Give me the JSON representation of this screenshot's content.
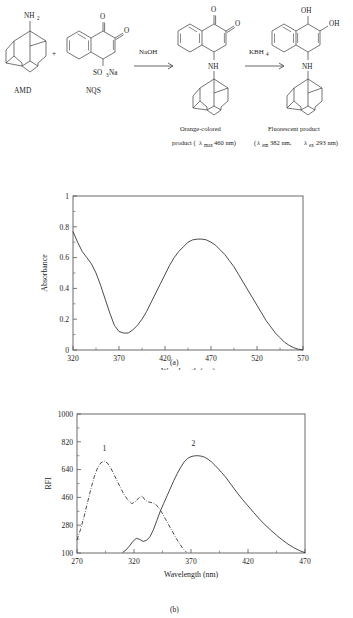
{
  "scheme": {
    "reactants": [
      {
        "name": "AMD",
        "group_label": "NH",
        "group_sub": "2"
      },
      {
        "name": "NQS",
        "group_label": "SO",
        "group_sub": "3",
        "group_tail": "Na"
      }
    ],
    "plus_sign": "+",
    "arrows": [
      {
        "reagent": "NaOH",
        "reagent_sub": ""
      },
      {
        "reagent": "KBH",
        "reagent_sub": "4"
      }
    ],
    "products": [
      {
        "nh_label": "NH",
        "o_labels": [
          "O",
          "O"
        ],
        "caption_line1": "Orange-colored",
        "caption_line2_pre": "product (",
        "caption_lambda": "λ",
        "caption_lambda_sub": "max",
        "caption_line2_post": " 460 nm)"
      },
      {
        "nh_label": "NH",
        "oh_labels": [
          "OH",
          "OH"
        ],
        "caption_line1": "Fluorescent product",
        "caption_line2_pre": "(",
        "caption_lambda1": "λ",
        "caption_lambda1_sub": "em",
        "caption_mid": " 382 nm, ",
        "caption_lambda2": "λ",
        "caption_lambda2_sub": "ex",
        "caption_line2_post": " 293 nm)"
      }
    ]
  },
  "panel_a_caption": "(a)",
  "panel_b_caption": "(b)",
  "chart_data": [
    {
      "type": "line",
      "panel": "(a)",
      "title": "",
      "xlabel": "Wavelength (nm)",
      "ylabel": "Absorbance",
      "xlim": [
        320,
        570
      ],
      "ylim": [
        0,
        1
      ],
      "xticks": [
        320,
        370,
        420,
        470,
        520,
        570
      ],
      "yticks": [
        0,
        0.2,
        0.4,
        0.6,
        0.8,
        1
      ],
      "xtick_labels": [
        "320",
        "370",
        "420",
        "470",
        "520",
        "570"
      ],
      "ytick_labels": [
        "0",
        "0.2",
        "0.4",
        "0.6",
        "0.8",
        "1"
      ],
      "minor_ticks": true,
      "grid": false,
      "legend": "none",
      "series": [
        {
          "name": "Absorption spectrum of orange-colored product",
          "style": "solid",
          "x": [
            320,
            325,
            330,
            335,
            340,
            345,
            350,
            355,
            360,
            365,
            370,
            375,
            380,
            385,
            390,
            395,
            400,
            405,
            410,
            415,
            420,
            425,
            430,
            435,
            440,
            445,
            450,
            455,
            460,
            465,
            470,
            475,
            480,
            485,
            490,
            495,
            500,
            505,
            510,
            515,
            520,
            525,
            530,
            535,
            540,
            545,
            550,
            555,
            560,
            565,
            570
          ],
          "y": [
            0.77,
            0.7,
            0.64,
            0.6,
            0.56,
            0.5,
            0.42,
            0.33,
            0.24,
            0.16,
            0.12,
            0.11,
            0.11,
            0.13,
            0.16,
            0.2,
            0.25,
            0.31,
            0.37,
            0.43,
            0.49,
            0.55,
            0.6,
            0.64,
            0.67,
            0.7,
            0.715,
            0.72,
            0.72,
            0.715,
            0.7,
            0.68,
            0.65,
            0.62,
            0.58,
            0.54,
            0.49,
            0.44,
            0.39,
            0.34,
            0.29,
            0.24,
            0.19,
            0.15,
            0.11,
            0.08,
            0.05,
            0.03,
            0.015,
            0.005,
            0.0
          ]
        }
      ]
    },
    {
      "type": "line",
      "panel": "(b)",
      "title": "",
      "xlabel": "Wavelength (nm)",
      "ylabel": "RFI",
      "xlim": [
        270,
        470
      ],
      "ylim": [
        100,
        1000
      ],
      "xticks": [
        270,
        320,
        370,
        420,
        470
      ],
      "yticks": [
        100,
        280,
        460,
        640,
        820,
        1000
      ],
      "xtick_labels": [
        "270",
        "320",
        "370",
        "420",
        "470"
      ],
      "ytick_labels": [
        "100",
        "280",
        "460",
        "640",
        "820",
        "1000"
      ],
      "minor_ticks": true,
      "grid": false,
      "legend": "inline-numbers",
      "series": [
        {
          "name": "1",
          "label": "1",
          "style": "dash-dot",
          "label_x": 294,
          "label_y": 760,
          "x": [
            270,
            273,
            276,
            279,
            282,
            285,
            288,
            291,
            294,
            297,
            300,
            303,
            306,
            309,
            312,
            315,
            318,
            321,
            324,
            327,
            330,
            333,
            336,
            339,
            342,
            345,
            348,
            351,
            354,
            357,
            360,
            363,
            366
          ],
          "y": [
            185,
            250,
            330,
            420,
            510,
            590,
            650,
            685,
            695,
            680,
            645,
            600,
            555,
            510,
            470,
            440,
            420,
            430,
            455,
            470,
            440,
            430,
            425,
            415,
            390,
            355,
            315,
            275,
            235,
            195,
            160,
            128,
            105
          ]
        },
        {
          "name": "2",
          "label": "2",
          "style": "solid",
          "label_x": 372,
          "label_y": 790,
          "x": [
            310,
            313,
            316,
            319,
            322,
            325,
            328,
            331,
            334,
            337,
            340,
            343,
            346,
            349,
            352,
            355,
            358,
            361,
            364,
            367,
            370,
            373,
            376,
            379,
            382,
            385,
            388,
            391,
            394,
            397,
            400,
            405,
            410,
            415,
            420,
            425,
            430,
            435,
            440,
            445,
            450,
            455,
            460,
            465,
            470
          ],
          "y": [
            103,
            120,
            145,
            175,
            195,
            188,
            175,
            182,
            205,
            250,
            310,
            370,
            420,
            470,
            520,
            570,
            615,
            655,
            690,
            712,
            724,
            729,
            730,
            727,
            720,
            707,
            690,
            668,
            645,
            620,
            595,
            545,
            495,
            448,
            405,
            362,
            320,
            282,
            248,
            215,
            185,
            158,
            135,
            116,
            102
          ]
        }
      ]
    }
  ]
}
